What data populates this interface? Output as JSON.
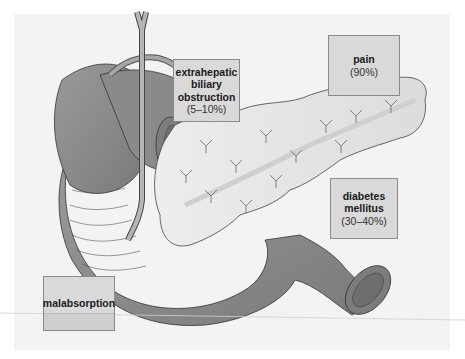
{
  "figure": {
    "background_color": "#f3f3f3",
    "organ_fill_dark": "#8c8c8c",
    "pancreas_fill": "#e6e6e6",
    "label_box_fill": "#d9d9d9"
  },
  "labels": {
    "biliary": {
      "title_line1": "extrahepatic",
      "title_line2": "biliary",
      "title_line3": "obstruction",
      "percent": "(5–10%)"
    },
    "pain": {
      "title": "pain",
      "percent": "(90%)"
    },
    "diabetes": {
      "title_line1": "diabetes",
      "title_line2": "mellitus",
      "percent": "(30–40%)"
    },
    "malabsorption": {
      "title": "malabsorption"
    }
  }
}
